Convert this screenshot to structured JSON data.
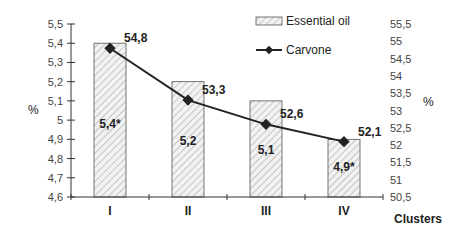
{
  "chart_data": {
    "type": "bar+line",
    "title": "",
    "categories": [
      "I",
      "II",
      "III",
      "IV"
    ],
    "xlabel": "Clusters",
    "ylabel_left": "%",
    "ylabel_right": "%",
    "ylim_left": [
      4.6,
      5.5
    ],
    "ylim_right": [
      50.5,
      55.5
    ],
    "yticks_left": [
      "4,6",
      "4,7",
      "4,8",
      "4,9",
      "5",
      "5,1",
      "5,2",
      "5,3",
      "5,4",
      "5,5"
    ],
    "yticks_right": [
      "50,5",
      "51",
      "51,5",
      "52",
      "52,5",
      "53",
      "53,5",
      "54",
      "54,5",
      "55",
      "55,5"
    ],
    "series": [
      {
        "name": "Essential oil",
        "type": "bar",
        "axis": "left",
        "values": [
          5.4,
          5.2,
          5.1,
          4.9
        ],
        "labels": [
          "5,4*",
          "5,2",
          "5,1",
          "4,9*"
        ]
      },
      {
        "name": "Carvone",
        "type": "line",
        "axis": "right",
        "values": [
          54.8,
          53.3,
          52.6,
          52.1
        ],
        "labels": [
          "54,8",
          "53,3",
          "52,6",
          "52,1"
        ]
      }
    ],
    "legend": {
      "position": "top-right",
      "entries": [
        "Essential oil",
        "Carvone"
      ]
    },
    "grid": false
  }
}
